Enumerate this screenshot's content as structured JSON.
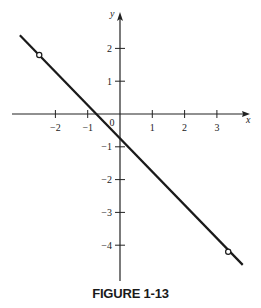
{
  "caption": "FIGURE 1-13",
  "chart_data": {
    "type": "line",
    "title": "FIGURE 1-13",
    "xlabel": "x",
    "ylabel": "y",
    "xlim": [
      -3.1,
      4.0
    ],
    "ylim": [
      -5.0,
      3.1
    ],
    "grid": false,
    "x_ticks": [
      -2,
      -1,
      1,
      2,
      3
    ],
    "x_tick_labels": [
      "−2",
      "−1",
      "1",
      "2",
      "3"
    ],
    "y_ticks": [
      2,
      1,
      -1,
      -2,
      -3,
      -4
    ],
    "y_tick_labels": [
      "2",
      "1",
      "−1",
      "−2",
      "−3",
      "−4"
    ],
    "origin_label": "0",
    "series": [
      {
        "name": "line",
        "x": [
          -3.1,
          3.8
        ],
        "y": [
          2.4,
          -4.6
        ],
        "color": "#1a1a1a"
      }
    ],
    "marked_points": [
      {
        "x": -2.5,
        "y": 1.8,
        "style": "open-circle"
      },
      {
        "x": 3.35,
        "y": -4.2,
        "style": "open-circle"
      }
    ]
  }
}
